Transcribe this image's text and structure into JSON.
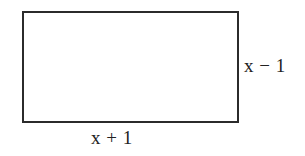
{
  "figure": {
    "type": "geometry-diagram",
    "shape": "rectangle",
    "background_color": "#ffffff",
    "stroke_color": "#2b2b2b",
    "text_color": "#222222",
    "rectangle": {
      "x": 22,
      "y": 11,
      "width": 213,
      "height": 108,
      "border_width": 2
    },
    "labels": {
      "width_label": "x + 1",
      "height_label": "x − 1"
    }
  }
}
